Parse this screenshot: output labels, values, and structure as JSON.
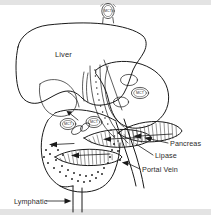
{
  "figure": {
    "background_color": "#ffffff",
    "ink_color": "#1a1a1a",
    "band_color": "#e3e3e3"
  },
  "labels": {
    "liver": "Liver",
    "pancreas": "Pancreas",
    "lipase": "Lipase",
    "portal_vein": "Portal Vein",
    "lymphatic": "Lymphatic"
  },
  "cells": {
    "top": "MCT",
    "stomach": "MCT",
    "gut_left": "MCT",
    "gut_right": "MCT"
  },
  "structures": [
    {
      "name": "liver",
      "label": "Liver"
    },
    {
      "name": "stomach",
      "label": ""
    },
    {
      "name": "pancreas",
      "label": "Pancreas"
    },
    {
      "name": "lipase",
      "label": "Lipase"
    },
    {
      "name": "portal-vein",
      "label": "Portal Vein"
    },
    {
      "name": "lymphatic-duct",
      "label": "Lymphatic"
    },
    {
      "name": "intestine",
      "label": ""
    }
  ]
}
